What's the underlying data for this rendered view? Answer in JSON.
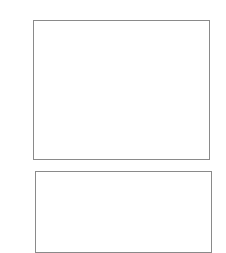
{
  "figure": {
    "label": "(a)",
    "colors": {
      "light_cell": "#d9d9d9",
      "dark_cell": "#7b7b7b",
      "cell_border": "#555555",
      "gap": "#ffffff"
    },
    "panels": [
      {
        "name": "upper",
        "description": "light cell layer above gap, dark cell layer below"
      },
      {
        "name": "lower",
        "description": "light cell layer with dark cells emerging at bottom edge"
      }
    ]
  }
}
